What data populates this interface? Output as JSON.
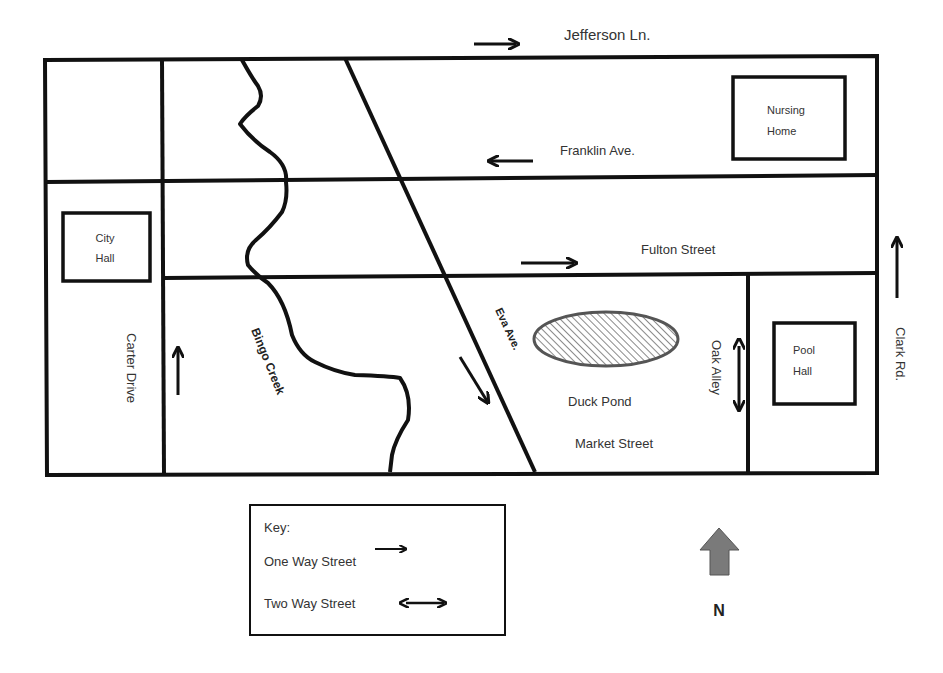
{
  "streets": {
    "jefferson": "Jefferson Ln.",
    "franklin": "Franklin Ave.",
    "fulton": "Fulton Street",
    "carter": "Carter Drive",
    "clark": "Clark Rd.",
    "eva": "Eva Ave.",
    "oak": "Oak Alley",
    "market": "Market Street"
  },
  "features": {
    "creek": "Bingo Creek",
    "pond": "Duck Pond"
  },
  "buildings": {
    "city_hall": [
      "City",
      "Hall"
    ],
    "nursing_home": [
      "Nursing",
      "Home"
    ],
    "pool_hall": [
      "Pool",
      "Hall"
    ]
  },
  "key": {
    "title": "Key:",
    "one_way": "One Way Street",
    "two_way": "Two Way Street"
  },
  "compass": {
    "label": "N",
    "color": "#7a7a7a"
  },
  "colors": {
    "line": "#111111",
    "pond_fill": "#bdbdbd",
    "pond_stroke": "#666666"
  }
}
